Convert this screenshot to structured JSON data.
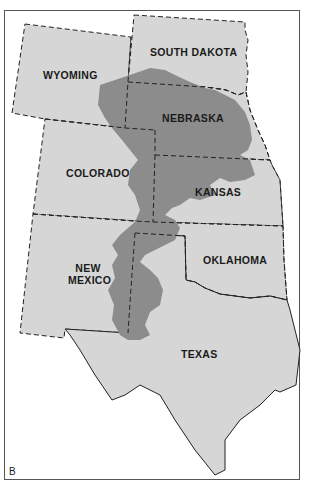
{
  "map": {
    "panel_label": "B",
    "colors": {
      "state_fill": "#d6d6d6",
      "aquifer_fill": "#8c8c8c",
      "border": "#222222",
      "background": "#ffffff"
    },
    "states": [
      {
        "id": "wyoming",
        "label": "WYOMING"
      },
      {
        "id": "south-dakota",
        "label": "SOUTH DAKOTA"
      },
      {
        "id": "nebraska",
        "label": "NEBRASKA"
      },
      {
        "id": "colorado",
        "label": "COLORADO"
      },
      {
        "id": "kansas",
        "label": "KANSAS"
      },
      {
        "id": "new-mexico",
        "label_line1": "NEW",
        "label_line2": "MEXICO"
      },
      {
        "id": "oklahoma",
        "label": "OKLAHOMA"
      },
      {
        "id": "texas",
        "label": "TEXAS"
      }
    ]
  }
}
